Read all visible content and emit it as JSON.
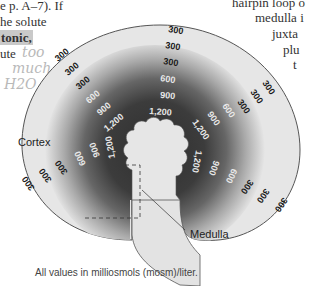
{
  "page_text": {
    "left_lines": [
      "e p. A–7). If",
      "he solute",
      "tonic,",
      "ute"
    ],
    "right_lines": [
      "hairpin loop o",
      "medulla i",
      "juxta",
      "plu",
      "t"
    ],
    "handwriting": [
      "too",
      "much",
      "H2O"
    ]
  },
  "diagram": {
    "regions": {
      "cortex": "Cortex",
      "medulla": "Medulla"
    },
    "colors": {
      "cortex_fill": "#e6e6e6",
      "gradient_outer": "#b0b0b0",
      "gradient_mid": "#6a6a6a",
      "gradient_inner": "#3a3a3a",
      "label_dark": "#1a1a1a",
      "label_light": "#e8e8e8",
      "outline": "#555555"
    },
    "labels": {
      "top_300_a": "300",
      "top_300_b": "300",
      "top_300_c": "300",
      "top_600": "600",
      "top_900": "900",
      "top_1200": "1,200",
      "ul_300_a": "300",
      "ul_300_b": "300",
      "ul_300_c": "300",
      "ul_600": "600",
      "ul_900": "900",
      "ul_1200": "1,200",
      "ur_300_a": "300",
      "ur_300_b": "300",
      "ur_300_c": "300",
      "ur_600": "600",
      "ur_900": "900",
      "ur_1200": "1,200",
      "ll_300_a": "300",
      "ll_300_b": "300",
      "ll_300_c": "300",
      "ll_600": "600",
      "ll_900": "900",
      "ll_1200": "1,200",
      "lr_300_a": "300",
      "lr_300_b": "300",
      "lr_300_c": "300",
      "lr_600": "600",
      "lr_900": "900",
      "lr_1200": "1,200"
    },
    "caption": "All values in milliosmols (mosm)/liter."
  }
}
